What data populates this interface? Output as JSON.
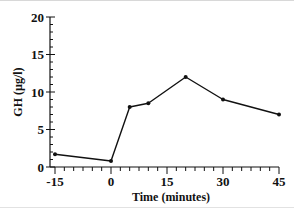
{
  "chart_data": {
    "type": "line",
    "title": "",
    "xlabel": "Time (minutes)",
    "ylabel": "GH (µg/l)",
    "x_ticks": [
      -15,
      0,
      15,
      30,
      45
    ],
    "y_ticks": [
      0,
      5,
      10,
      15,
      20
    ],
    "xlim": [
      -15,
      45
    ],
    "ylim": [
      0,
      20
    ],
    "grid": false,
    "legend": null,
    "series": [
      {
        "name": "GH",
        "x": [
          -15,
          0,
          5,
          10,
          20,
          30,
          45
        ],
        "values": [
          1.7,
          0.8,
          8.0,
          8.5,
          12.0,
          9.0,
          7.0
        ]
      }
    ]
  },
  "labels": {
    "xlabel": "Time (minutes)",
    "ylabel": "GH (µg/l)",
    "x_ticks": [
      "-15",
      "0",
      "15",
      "30",
      "45"
    ],
    "y_ticks": [
      "0",
      "5",
      "10",
      "15",
      "20"
    ]
  },
  "colors": {
    "line": "#111111",
    "axis": "#111111",
    "background": "#ffffff"
  }
}
